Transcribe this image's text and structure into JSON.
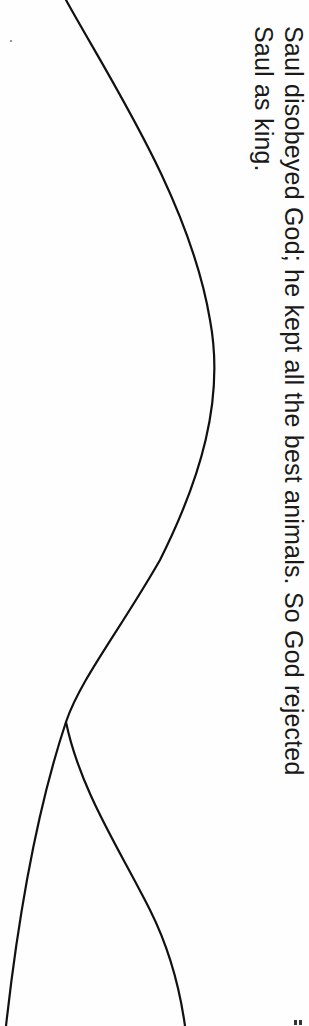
{
  "worksheet": {
    "orientation": "rotated-90-clockwise",
    "caption": {
      "lines": [
        "Saul disobeyed God; he kept all the best animals.  So God rejected",
        "Saul as king."
      ]
    },
    "cut_lines": {
      "stroke_color": "#111111",
      "shape": "S-curve splitting into two branches near bottom"
    },
    "marks": {
      "corner_mark": "registration-tick",
      "stray_dot": "scan-speck"
    }
  }
}
